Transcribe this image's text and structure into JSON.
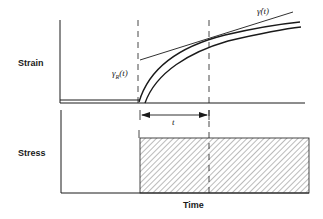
{
  "diagram": {
    "type": "creep-curve",
    "panels": {
      "strain": {
        "ylabel": "Strain",
        "annotations": {
          "tangent_label": "γ̇(t)",
          "recoverable_label": "γ",
          "recoverable_sub": "R",
          "recoverable_arg": "(t)"
        }
      },
      "stress": {
        "ylabel": "Stress",
        "interval_label": "t"
      }
    },
    "xlabel": "Time",
    "colors": {
      "line": "#1a1a1a",
      "background": "#ffffff"
    }
  }
}
